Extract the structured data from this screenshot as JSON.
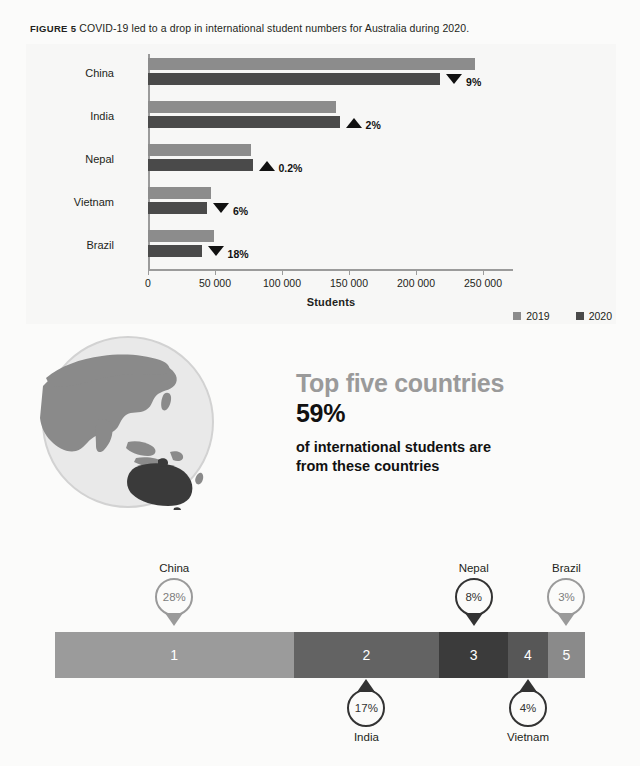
{
  "figure": {
    "number_label": "FIGURE 5",
    "caption": "COVID-19 led to a drop in international student numbers for Australia during 2020."
  },
  "chart_data": [
    {
      "type": "bar",
      "orientation": "horizontal",
      "title": "COVID-19 led to a drop in international student numbers for Australia during 2020.",
      "xlabel": "Students",
      "ylabel": "",
      "xlim": [
        0,
        265000
      ],
      "xticks": [
        0,
        50000,
        100000,
        150000,
        200000,
        250000
      ],
      "xticklabels": [
        "0",
        "50 000",
        "100 000",
        "150 000",
        "200 000",
        "250 000"
      ],
      "grid": false,
      "legend_position": "bottom-right",
      "categories": [
        "China",
        "India",
        "Nepal",
        "Vietnam",
        "Brazil"
      ],
      "series": [
        {
          "name": "2019",
          "color": "#8c8c8c",
          "values": [
            244000,
            140000,
            77000,
            47000,
            49000
          ]
        },
        {
          "name": "2020",
          "color": "#4a4a4a",
          "values": [
            218000,
            143000,
            78000,
            44000,
            40000
          ]
        }
      ],
      "annotations": [
        {
          "category": "China",
          "text": "9%",
          "direction": "down"
        },
        {
          "category": "India",
          "text": "2%",
          "direction": "up"
        },
        {
          "category": "Nepal",
          "text": "0.2%",
          "direction": "up"
        },
        {
          "category": "Vietnam",
          "text": "6%",
          "direction": "down"
        },
        {
          "category": "Brazil",
          "text": "18%",
          "direction": "down"
        }
      ]
    },
    {
      "type": "bar",
      "subtype": "stacked-single",
      "title": "Top five countries share of international students",
      "categories": [
        "China",
        "India",
        "Nepal",
        "Vietnam",
        "Brazil"
      ],
      "values": [
        28,
        17,
        8,
        4,
        3
      ],
      "value_labels": [
        "28%",
        "17%",
        "8%",
        "4%",
        "3%"
      ],
      "rank_labels": [
        "1",
        "2",
        "3",
        "4",
        "5"
      ],
      "segment_colors": [
        "#9b9b9b",
        "#636363",
        "#3b3b3b",
        "#575757",
        "#8a8a8a"
      ],
      "total_label": "59%",
      "xlabel": "",
      "ylabel": "",
      "grid": false
    }
  ],
  "bar_chart": {
    "axis_title": "Students",
    "xticklabels": [
      "0",
      "50 000",
      "100 000",
      "150 000",
      "200 000",
      "250 000"
    ],
    "categories": [
      {
        "label": "China",
        "v2019": 244000,
        "v2020": 218000,
        "delta": "9%",
        "dir": "down"
      },
      {
        "label": "India",
        "v2019": 140000,
        "v2020": 143000,
        "delta": "2%",
        "dir": "up"
      },
      {
        "label": "Nepal",
        "v2019": 77000,
        "v2020": 78000,
        "delta": "0.2%",
        "dir": "up"
      },
      {
        "label": "Vietnam",
        "v2019": 47000,
        "v2020": 44000,
        "delta": "6%",
        "dir": "down"
      },
      {
        "label": "Brazil",
        "v2019": 49000,
        "v2020": 40000,
        "delta": "18%",
        "dir": "down"
      }
    ],
    "legend": [
      {
        "label": "2019",
        "color": "#8c8c8c"
      },
      {
        "label": "2020",
        "color": "#4a4a4a"
      }
    ]
  },
  "stat_block": {
    "heading": "Top five countries",
    "figure": "59%",
    "description_line_1": "of international students are",
    "description_line_2": "from these countries"
  },
  "globe": {
    "icon_name": "globe-asia-australia",
    "ocean_color": "#e6e6e6",
    "land_color": "#8a8a8a",
    "highlight_color": "#3a3a3a"
  },
  "share_bar": {
    "segments": [
      {
        "rank": "1",
        "country": "China",
        "percent": "28%",
        "color": "#9b9b9b",
        "width_pct": 45.0,
        "marker": "above",
        "tone": "light"
      },
      {
        "rank": "2",
        "country": "India",
        "percent": "17%",
        "color": "#636363",
        "width_pct": 27.5,
        "marker": "below",
        "tone": "dark"
      },
      {
        "rank": "3",
        "country": "Nepal",
        "percent": "8%",
        "color": "#3b3b3b",
        "width_pct": 13.0,
        "marker": "above",
        "tone": "dark"
      },
      {
        "rank": "4",
        "country": "Vietnam",
        "percent": "4%",
        "color": "#575757",
        "width_pct": 7.5,
        "marker": "below",
        "tone": "dark"
      },
      {
        "rank": "5",
        "country": "Brazil",
        "percent": "3%",
        "color": "#8a8a8a",
        "width_pct": 7.0,
        "marker": "above",
        "tone": "light"
      }
    ]
  }
}
